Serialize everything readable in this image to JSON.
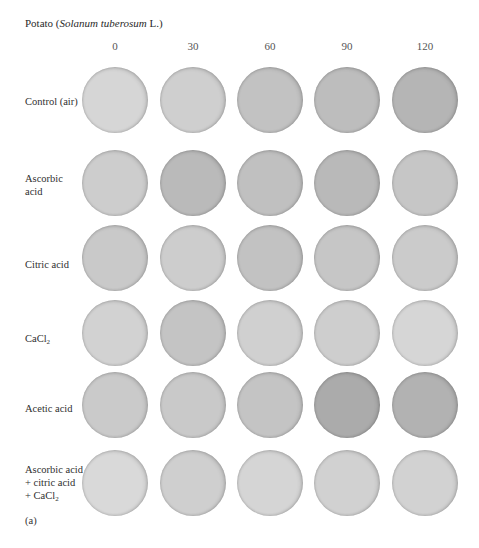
{
  "figure": {
    "title_prefix": "Potato (",
    "title_italic": "Solanum tuberosum",
    "title_suffix": " L.)",
    "panel_label": "(a)"
  },
  "columns": [
    "0",
    "30",
    "60",
    "90",
    "120"
  ],
  "rows": [
    {
      "label_lines": [
        "Control (air)"
      ],
      "shades": [
        "#d6d6d6",
        "#cfcfcf",
        "#c2c2c2",
        "#bdbdbd",
        "#b5b5b5"
      ]
    },
    {
      "label_lines": [
        "Ascorbic",
        "acid"
      ],
      "shades": [
        "#cdcdcd",
        "#bababa",
        "#c0c0c0",
        "#b9b9b9",
        "#c6c6c6"
      ]
    },
    {
      "label_lines": [
        "Citric acid"
      ],
      "shades": [
        "#c9c9c9",
        "#cdcdcd",
        "#c2c2c2",
        "#c6c6c6",
        "#cbcbcb"
      ]
    },
    {
      "label_lines": [
        "CaCl",
        "2"
      ],
      "shades": [
        "#d2d2d2",
        "#c4c4c4",
        "#d0d0d0",
        "#cecece",
        "#d6d6d6"
      ]
    },
    {
      "label_lines": [
        "Acetic acid"
      ],
      "shades": [
        "#cacaca",
        "#c9c9c9",
        "#c4c4c4",
        "#ababab",
        "#b2b2b2"
      ]
    },
    {
      "label_lines": [
        "Ascorbic acid",
        "+ citric acid",
        "+ CaCl",
        "2"
      ],
      "shades": [
        "#d9d9d9",
        "#cfcfcf",
        "#d5d5d5",
        "#d1d1d1",
        "#d2d2d2"
      ]
    }
  ]
}
